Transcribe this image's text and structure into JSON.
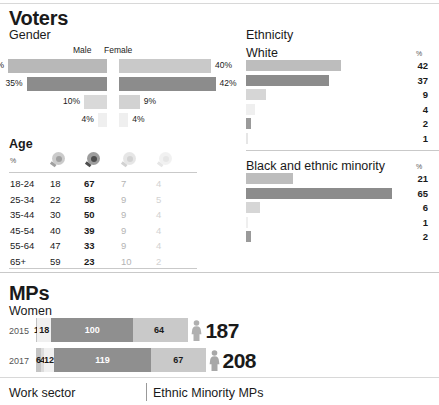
{
  "sections": {
    "voters": {
      "title": "Voters"
    },
    "mps": {
      "title": "MPs"
    }
  },
  "gender": {
    "title": "Gender",
    "col_male": "Male",
    "col_female": "Female",
    "rows": [
      {
        "male_pct": "43%",
        "female_pct": "40%",
        "male_value": 43,
        "female_value": 40,
        "male_color": "#b8b8b8",
        "female_color": "#c9c9c9"
      },
      {
        "male_pct": "35%",
        "female_pct": "42%",
        "male_value": 35,
        "female_value": 42,
        "male_color": "#8c8c8c",
        "female_color": "#8c8c8c"
      },
      {
        "male_pct": "10%",
        "female_pct": "9%",
        "male_value": 10,
        "female_value": 9,
        "male_color": "#d9d9d9",
        "female_color": "#d2d2d2"
      },
      {
        "male_pct": "4%",
        "female_pct": "4%",
        "male_value": 4,
        "female_value": 4,
        "male_color": "#efefef",
        "female_color": "#efefef"
      }
    ]
  },
  "age": {
    "title": "Age",
    "pct_symbol": "%",
    "party_icons": [
      {
        "name": "rosette-icon-party-1",
        "color": "#a0a0a0"
      },
      {
        "name": "rosette-icon-party-2",
        "color": "#4d4d4d"
      },
      {
        "name": "rosette-icon-party-3",
        "color": "#d2d2d2"
      },
      {
        "name": "rosette-icon-party-4",
        "color": "#e6e6e6"
      }
    ],
    "rows": [
      {
        "band": "18-24",
        "v1": "18",
        "v2": "67",
        "v3": "7",
        "v4": "4"
      },
      {
        "band": "25-34",
        "v1": "22",
        "v2": "58",
        "v3": "9",
        "v4": "5"
      },
      {
        "band": "35-44",
        "v1": "30",
        "v2": "50",
        "v3": "9",
        "v4": "4"
      },
      {
        "band": "45-54",
        "v1": "40",
        "v2": "39",
        "v3": "9",
        "v4": "4"
      },
      {
        "band": "55-64",
        "v1": "47",
        "v2": "33",
        "v3": "9",
        "v4": "4"
      },
      {
        "band": "65+",
        "v1": "59",
        "v2": "23",
        "v3": "10",
        "v4": "2"
      }
    ]
  },
  "ethnicity": {
    "title": "Ethnicity",
    "pct_symbol": "%",
    "groups": [
      {
        "label": "White",
        "bars": [
          {
            "value": 42,
            "display": "42",
            "color": "#bdbdbd"
          },
          {
            "value": 37,
            "display": "37",
            "color": "#8c8c8c"
          },
          {
            "value": 9,
            "display": "9",
            "color": "#d6d6d6"
          },
          {
            "value": 4,
            "display": "4",
            "color": "#efefef"
          },
          {
            "value": 2,
            "display": "2",
            "color": "#9a9a9a"
          },
          {
            "value": 1,
            "display": "1",
            "color": "#e6e6e6"
          }
        ]
      },
      {
        "label": "Black and ethnic minority",
        "bars": [
          {
            "value": 21,
            "display": "21",
            "color": "#bdbdbd"
          },
          {
            "value": 65,
            "display": "65",
            "color": "#8c8c8c"
          },
          {
            "value": 6,
            "display": "6",
            "color": "#d6d6d6"
          },
          {
            "value": 1,
            "display": "1",
            "color": "#efefef"
          },
          {
            "value": 2,
            "display": "2",
            "color": "#9a9a9a"
          }
        ]
      }
    ]
  },
  "mps": {
    "women_title": "Women",
    "rows": [
      {
        "year": "2015",
        "total": "187",
        "icon": "female-figure-icon",
        "icon_color": "#b0b0b0",
        "segments": [
          {
            "display": "1",
            "value": 1,
            "color": "#c4c4c4",
            "text_color": "#1a1a1a",
            "show_label": true
          },
          {
            "display": "18",
            "value": 18,
            "color": "#f0f0f0",
            "text_color": "#1a1a1a",
            "show_label": true
          },
          {
            "display": "100",
            "value": 100,
            "color": "#8f8f8f",
            "text_color": "#ffffff",
            "show_label": true
          },
          {
            "display": "64",
            "value": 64,
            "color": "#c9c9c9",
            "text_color": "#1a1a1a",
            "show_label": true
          },
          {
            "display": "4",
            "value": 4,
            "color": "#c9c9c9",
            "text_color": "#1a1a1a",
            "show_label": false
          }
        ]
      },
      {
        "year": "2017",
        "total": "208",
        "icon": "female-figure-icon",
        "icon_color": "#a8a8a8",
        "segments": [
          {
            "display": "6",
            "value": 6,
            "color": "#c4c4c4",
            "text_color": "#1a1a1a",
            "show_label": true
          },
          {
            "display": "4",
            "value": 4,
            "color": "#dcdcdc",
            "text_color": "#1a1a1a",
            "show_label": true
          },
          {
            "display": "12",
            "value": 12,
            "color": "#f0f0f0",
            "text_color": "#1a1a1a",
            "show_label": true
          },
          {
            "display": "119",
            "value": 119,
            "color": "#8f8f8f",
            "text_color": "#ffffff",
            "show_label": true
          },
          {
            "display": "67",
            "value": 67,
            "color": "#c9c9c9",
            "text_color": "#1a1a1a",
            "show_label": true
          }
        ]
      }
    ]
  },
  "footer": {
    "work_sector": "Work sector",
    "ethnic_minority_mps": "Ethnic Minority MPs"
  },
  "chart_data": {
    "type": "bar",
    "charts": [
      {
        "type": "bar",
        "title": "Gender",
        "subtype": "diverging",
        "categories": [
          "Male",
          "Female"
        ],
        "series": [
          {
            "name": "row1",
            "values": [
              43,
              40
            ]
          },
          {
            "name": "row2",
            "values": [
              35,
              42
            ]
          },
          {
            "name": "row3",
            "values": [
              10,
              9
            ]
          },
          {
            "name": "row4",
            "values": [
              4,
              4
            ]
          }
        ],
        "unit": "%",
        "xlabel": "",
        "ylabel": "",
        "grid": false
      },
      {
        "type": "table",
        "title": "Age",
        "columns": [
          "%",
          "party-1",
          "party-2",
          "party-3",
          "party-4"
        ],
        "rows": [
          [
            "18-24",
            18,
            67,
            7,
            4
          ],
          [
            "25-34",
            22,
            58,
            9,
            5
          ],
          [
            "35-44",
            30,
            50,
            9,
            4
          ],
          [
            "45-54",
            40,
            39,
            9,
            4
          ],
          [
            "55-64",
            47,
            33,
            9,
            4
          ],
          [
            "65+",
            59,
            23,
            10,
            2
          ]
        ],
        "unit": "%"
      },
      {
        "type": "bar",
        "title": "Ethnicity — White",
        "values": [
          42,
          37,
          9,
          4,
          2,
          1
        ],
        "unit": "%",
        "xlim": [
          0,
          70
        ],
        "grid": false
      },
      {
        "type": "bar",
        "title": "Ethnicity — Black and ethnic minority",
        "values": [
          21,
          65,
          6,
          1,
          2
        ],
        "unit": "%",
        "xlim": [
          0,
          70
        ],
        "grid": false
      },
      {
        "type": "bar",
        "subtype": "stacked",
        "title": "MPs — Women",
        "categories": [
          "2015",
          "2017"
        ],
        "series": [
          {
            "name": "2015",
            "values": [
              1,
              18,
              100,
              64,
              4
            ],
            "total": 187
          },
          {
            "name": "2017",
            "values": [
              6,
              4,
              12,
              119,
              67
            ],
            "total": 208
          }
        ],
        "ylabel": "",
        "grid": false
      }
    ]
  }
}
